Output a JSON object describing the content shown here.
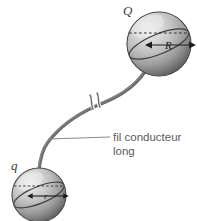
{
  "figure": {
    "background_color": "#ffffff",
    "sphere_colors": {
      "highlight": "#e8e8e8",
      "midtone": "#b4b4b4",
      "shadow": "#5e5e5e",
      "outline": "#4a4a4a"
    },
    "wire_color": "#6e6e6e",
    "leader_color": "#8a8a8a",
    "text_color": "#5a5a5a",
    "label_color": "#3b3b3b"
  },
  "upper_sphere": {
    "charge_label": "Q",
    "radius_label": "R",
    "center_x": 159,
    "center_y": 44,
    "radius": 32
  },
  "lower_sphere": {
    "charge_label": "q",
    "radius_label": "r",
    "center_x": 39,
    "center_y": 195,
    "radius": 27
  },
  "wire": {
    "break_symbol": "double-slash-break",
    "description": "fil"
  },
  "annotation": {
    "line1": "fil conducteur",
    "line2": "long",
    "leader_from_x": 48,
    "leader_from_y": 139,
    "leader_to_x": 110,
    "leader_to_y": 137
  }
}
